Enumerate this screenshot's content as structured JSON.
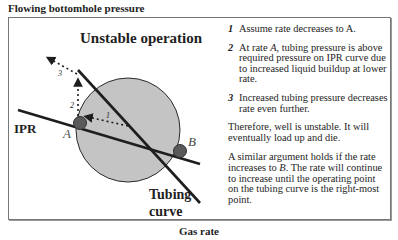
{
  "axes": {
    "y_label": "Flowing bottomhole pressure",
    "x_label": "Gas rate"
  },
  "diagram": {
    "title": "Unstable operation",
    "curves": {
      "ipr_label": "IPR",
      "tubing_label_line1": "Tubing",
      "tubing_label_line2": "curve"
    },
    "points": {
      "a_label": "A",
      "b_label": "B"
    },
    "step_markers": [
      "1",
      "2",
      "3"
    ],
    "colors": {
      "circle_fill": "#c4c4c4",
      "line": "#1e1e1e",
      "point": "#5a5a5a"
    }
  },
  "notes": {
    "steps": [
      {
        "num": "1",
        "text": "Assume rate decreases to A."
      },
      {
        "num": "2",
        "text_before": "At rate ",
        "italic": "A",
        "text_after": ", tubing pressure is above required pressure on IPR curve due to increased liquid buildup at lower rate."
      },
      {
        "num": "3",
        "text": "Increased tubing pressure decreases rate even further."
      }
    ],
    "conclusion": "Therefore, well is unstable. It will eventually load up and die.",
    "similar": {
      "text_before": "A similar argument holds if the rate increases to ",
      "italic": "B",
      "text_after": ". The rate will continue to increase until the operating point on the tubing curve is the right-most point."
    }
  }
}
